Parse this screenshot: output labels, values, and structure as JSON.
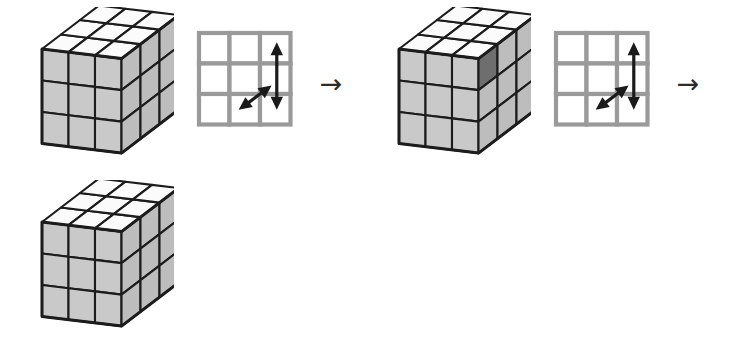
{
  "figure": {
    "kind": "rubiks-cube-move-sequence",
    "background_color": "#ffffff",
    "steps": [
      {
        "type": "cube",
        "name": "cube-state-1",
        "highlighted_cell": null
      },
      {
        "type": "grid",
        "name": "move-diagram-1",
        "label": "3x3 face grid with vertical and diagonal double arrows"
      },
      {
        "type": "arrow",
        "name": "sequence-arrow-1",
        "glyph": "→"
      },
      {
        "type": "cube",
        "name": "cube-state-2",
        "highlighted_cell": "right-face-top-left"
      },
      {
        "type": "grid",
        "name": "move-diagram-2",
        "label": "3x3 face grid with vertical and diagonal double arrows"
      },
      {
        "type": "arrow",
        "name": "sequence-arrow-2",
        "glyph": "→"
      },
      {
        "type": "cube",
        "name": "cube-state-3",
        "highlighted_cell": null
      }
    ]
  },
  "colors": {
    "cube_outline": "#1c1c1c",
    "cube_top_face": "#fbfbfb",
    "cube_left_face": "#c9c9c9",
    "cube_right_face": "#bdbdbd",
    "cube_highlight_cell": "#6e6e6e",
    "grid_line": "#9a9a9a",
    "grid_cell": "#ffffff",
    "arrow_stroke": "#1a1a1a",
    "sequence_arrow": "#2b2b2b"
  },
  "grid_diagram": {
    "rows": 3,
    "columns": 3,
    "arrows": [
      {
        "name": "vertical-double-arrow",
        "direction": "up-down",
        "column": 3
      },
      {
        "name": "diagonal-double-arrow",
        "direction": "upper-right-to-lower-left"
      }
    ]
  }
}
